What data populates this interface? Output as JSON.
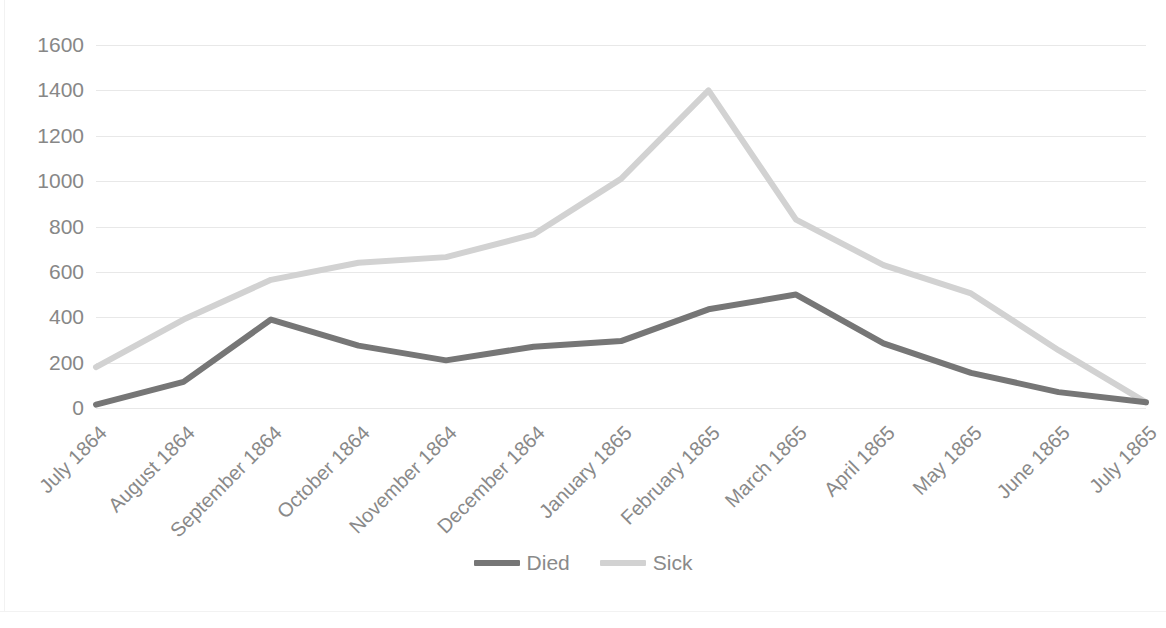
{
  "chart_data": {
    "type": "line",
    "title": "",
    "xlabel": "",
    "ylabel": "",
    "ylim": [
      0,
      1600
    ],
    "y_ticks": [
      1600,
      1400,
      1200,
      1000,
      800,
      600,
      400,
      200,
      0
    ],
    "grid": true,
    "legend_position": "bottom",
    "categories": [
      "July 1864",
      "August 1864",
      "September 1864",
      "October 1864",
      "November 1864",
      "December 1864",
      "January 1865",
      "February 1865",
      "March 1865",
      "April 1865",
      "May 1865",
      "June 1865",
      "July 1865"
    ],
    "series": [
      {
        "name": "Died",
        "color": "#767676",
        "values": [
          15,
          115,
          390,
          275,
          210,
          270,
          295,
          435,
          500,
          285,
          155,
          70,
          25
        ]
      },
      {
        "name": "Sick",
        "color": "#d2d2d2",
        "values": [
          180,
          390,
          565,
          640,
          665,
          765,
          1010,
          1400,
          830,
          630,
          505,
          255,
          25
        ]
      }
    ]
  },
  "legend": {
    "items": [
      {
        "label": "Died",
        "color": "#767676"
      },
      {
        "label": "Sick",
        "color": "#d2d2d2"
      }
    ]
  },
  "axis": {
    "y_tick_labels": [
      "1600",
      "1400",
      "1200",
      "1000",
      "800",
      "600",
      "400",
      "200",
      "0"
    ],
    "x_tick_labels": [
      "July 1864",
      "August 1864",
      "September 1864",
      "October 1864",
      "November 1864",
      "December 1864",
      "January 1865",
      "February 1865",
      "March 1865",
      "April 1865",
      "May 1865",
      "June 1865",
      "July 1865"
    ]
  },
  "colors": {
    "gridline": "#e8e8e8",
    "axis_text": "#8a8a8a",
    "plot_background": "#ffffff",
    "frame": "#f2f2f2"
  }
}
